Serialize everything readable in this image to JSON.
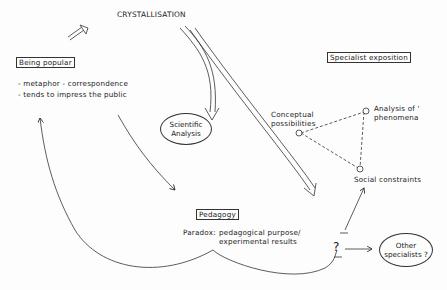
{
  "diagram": {
    "title": "CRYSTALLISATION",
    "nodes": {
      "being_popular": {
        "label": "Being popular",
        "bullets": [
          "- metaphor - correspondence",
          "- tends to impress the public"
        ]
      },
      "scientific_analysis": {
        "line1": "Scientific",
        "line2": "Analysis"
      },
      "specialist_exposition": {
        "label": "Specialist exposition"
      },
      "conceptual_possibilities": {
        "line1": "Conceptual",
        "line2": "possibilities"
      },
      "analysis_of_phenomena": {
        "line1": "Analysis of '",
        "line2": "phenomena"
      },
      "social_constraints": {
        "label": "Social constraints"
      },
      "pedagogy": {
        "label": "Pedagogy",
        "paradox_label": "Paradox:",
        "paradox_line1": "pedagogical purpose/",
        "paradox_line2": "experimental results"
      },
      "question": {
        "label": "?"
      },
      "other_specialists": {
        "line1": "Other",
        "line2": "specialists ?"
      }
    },
    "edges": [
      {
        "from": "top",
        "to": "scientific_analysis",
        "style": "double-line"
      },
      {
        "from": "top",
        "to": "question",
        "style": "double-line"
      },
      {
        "from": "being_popular",
        "to": "pedagogy",
        "style": "arrow"
      },
      {
        "from": "pedagogy",
        "to": "being_popular",
        "style": "curved-arrow"
      },
      {
        "from": "being_popular",
        "to": "crystallisation",
        "style": "hollow-arrow"
      },
      {
        "from": "conceptual_possibilities",
        "to": "analysis_of_phenomena",
        "style": "dashed"
      },
      {
        "from": "conceptual_possibilities",
        "to": "social_constraints",
        "style": "dashed"
      },
      {
        "from": "analysis_of_phenomena",
        "to": "social_constraints",
        "style": "dashed"
      },
      {
        "from": "question",
        "to": "social_constraints",
        "style": "arrow"
      },
      {
        "from": "question",
        "to": "other_specialists",
        "style": "arrow"
      }
    ]
  }
}
